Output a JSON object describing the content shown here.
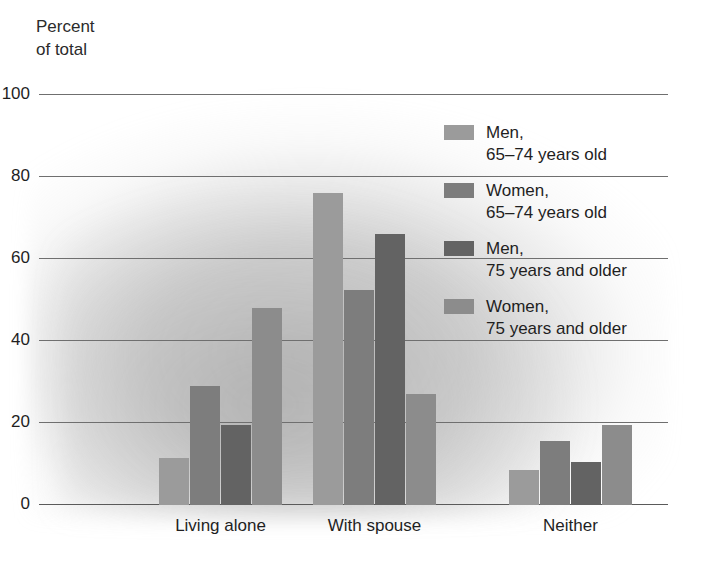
{
  "chart_data": {
    "type": "bar",
    "title": "",
    "subtitle": "",
    "ylabel": "Percent\nof total",
    "xlabel": "",
    "ylim": [
      0,
      100
    ],
    "yticks": [
      0,
      20,
      40,
      60,
      80,
      100
    ],
    "ytick_labels": [
      "0",
      "20",
      "40",
      "60",
      "80",
      "100"
    ],
    "grid": true,
    "legend_position": "upper-right-inside",
    "categories": [
      "Living alone",
      "With spouse",
      "Neither"
    ],
    "series": [
      {
        "name": "Men,\n65–74 years old",
        "color": "#9b9b9b",
        "values": [
          11.5,
          76,
          8.5
        ]
      },
      {
        "name": "Women,\n65–74 years old",
        "color": "#7d7d7d",
        "values": [
          29,
          52.5,
          15.5
        ]
      },
      {
        "name": "Men,\n75 years and older",
        "color": "#636363",
        "values": [
          19.5,
          66,
          10.5
        ]
      },
      {
        "name": "Women,\n75 years and older",
        "color": "#8c8c8c",
        "values": [
          48,
          27,
          19.5
        ]
      }
    ]
  },
  "axis": {
    "y_title": "Percent\nof total",
    "tick_100": "100",
    "tick_80": "80",
    "tick_60": "60",
    "tick_40": "40",
    "tick_20": "20",
    "tick_0": "0"
  },
  "categories": {
    "living_alone": "Living alone",
    "with_spouse": "With spouse",
    "neither": "Neither"
  },
  "legend": {
    "items": [
      {
        "label": "Men,\n65–74 years old",
        "color": "#9b9b9b"
      },
      {
        "label": "Women,\n65–74 years old",
        "color": "#7d7d7d"
      },
      {
        "label": "Men,\n75 years and older",
        "color": "#636363"
      },
      {
        "label": "Women,\n75 years and older",
        "color": "#8c8c8c"
      }
    ]
  },
  "colors": {
    "men_65_74": "#9b9b9b",
    "women_65_74": "#7d7d7d",
    "men_75_plus": "#636363",
    "women_75_plus": "#8c8c8c",
    "gridline": "#6f6f6f",
    "text": "#1f1f1f"
  }
}
